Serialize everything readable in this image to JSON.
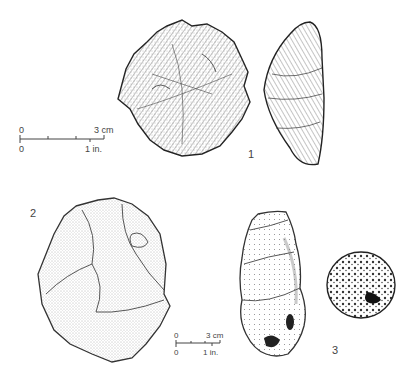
{
  "figure": {
    "artifacts": [
      {
        "id": "1",
        "label": "1",
        "description": "discoidal core, face view and side profile"
      },
      {
        "id": "2",
        "label": "2",
        "description": "flaked stone tool (stippled)"
      },
      {
        "id": "3",
        "label": "3",
        "description": "elongated stone and spherical pitted stone"
      }
    ],
    "scale_bars": [
      {
        "top_left": "0",
        "top_right": "3 cm",
        "bottom_left": "0",
        "bottom_right": "1 in."
      },
      {
        "top_left": "0",
        "top_right": "3 cm",
        "bottom_left": "0",
        "bottom_right": "1 in."
      }
    ],
    "colors": {
      "ink": "#333333",
      "background": "#ffffff"
    }
  }
}
